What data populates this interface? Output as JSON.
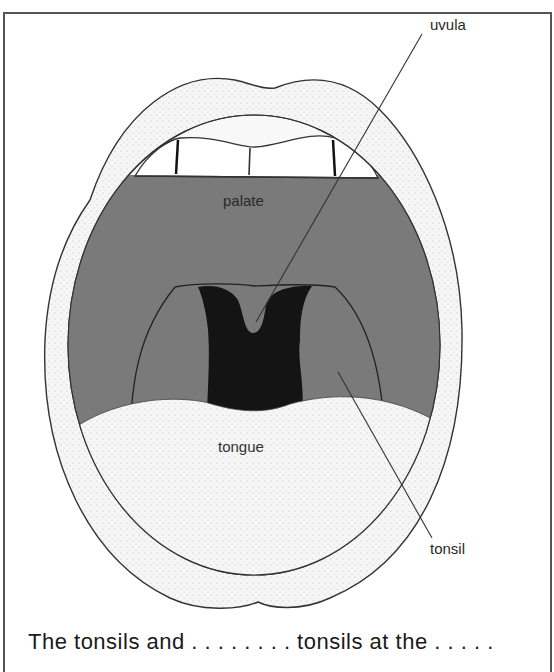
{
  "figure": {
    "labels": {
      "uvula": "uvula",
      "palate": "palate",
      "tongue": "tongue",
      "tonsil": "tonsil"
    },
    "caption": "The tonsils and . . . . . . . . tonsils at the . . . . ."
  },
  "colors": {
    "frame": "#555555",
    "cavity": "#7a7a7a",
    "throat": "#141414",
    "lips_tongue": "#f4f4f4",
    "outline": "#333333",
    "text": "#2a2a2a"
  }
}
